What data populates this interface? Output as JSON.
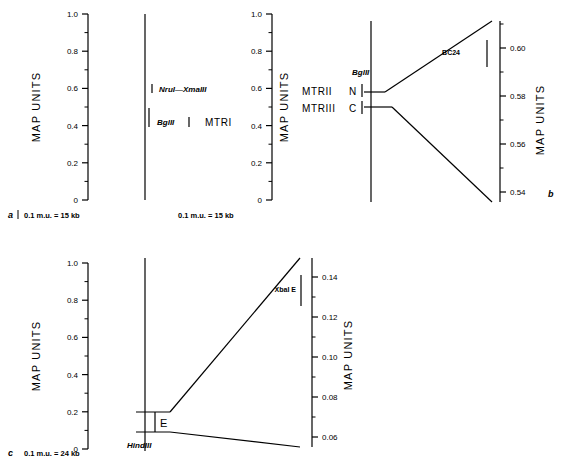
{
  "figure": {
    "axis_title": "MAP UNITS",
    "panels": [
      {
        "id": "a",
        "letter": "a",
        "scale_note": "0.1 m.u. = 15 kb",
        "left_axis": {
          "min": 0,
          "max": 1.0,
          "major_ticks": [
            "0",
            "0.2",
            "0.4",
            "0.6",
            "0.8",
            "1.0"
          ],
          "major_values": [
            0,
            0.2,
            0.4,
            0.6,
            0.8,
            1.0
          ],
          "minor_values": [
            0.1,
            0.3,
            0.5,
            0.7,
            0.9
          ]
        },
        "right_axis": {
          "min": 0,
          "max": 1.0,
          "major_ticks": [
            "0",
            "0.2",
            "0.4",
            "0.6",
            "0.8",
            "1.0"
          ],
          "major_values": [
            0,
            0.2,
            0.4,
            0.6,
            0.8,
            1.0
          ],
          "minor_values": [
            0.1,
            0.3,
            0.5,
            0.7,
            0.9
          ]
        },
        "right_scale_note": "0.1 m.u. = 15 kb",
        "chromosome_line": {
          "top_value": 1.0,
          "bottom_value": 0.0
        },
        "markers": [
          {
            "label": "NruI—XmaIII",
            "value": 0.6,
            "side": "right"
          },
          {
            "label": "BglII",
            "value": 0.42,
            "side": "right"
          }
        ],
        "locus": {
          "label": "MTRI",
          "value": 0.42
        }
      },
      {
        "id": "b",
        "letter": "b",
        "left_axis": null,
        "expanded_axis": {
          "min": 0.535,
          "max": 0.612,
          "major_ticks": [
            "0.54",
            "0.56",
            "0.58",
            "0.60"
          ],
          "major_values": [
            0.54,
            0.56,
            0.58,
            0.6
          ],
          "minor_values": [
            0.55,
            0.57,
            0.59,
            0.61
          ]
        },
        "chromosome_line": {
          "top_value": 1.0,
          "bottom_value": 0.0
        },
        "markers": [
          {
            "label": "BglII",
            "value": 0.583,
            "side": "above"
          }
        ],
        "loci": [
          {
            "name": "MTRII",
            "terminus": "N",
            "value": 0.583
          },
          {
            "name": "MTRIII",
            "terminus": "C",
            "value": 0.558
          }
        ],
        "clone": {
          "label": "BC24",
          "top_value": 0.608,
          "bottom_value": 0.596
        }
      },
      {
        "id": "c",
        "letter": "c",
        "scale_note": "0.1 m.u. = 24 kb",
        "left_axis": {
          "min": 0,
          "max": 1.0,
          "major_ticks": [
            "0",
            "0.2",
            "0.4",
            "0.6",
            "0.8",
            "1.0"
          ],
          "major_values": [
            0,
            0.2,
            0.4,
            0.6,
            0.8,
            1.0
          ],
          "minor_values": [
            0.1,
            0.3,
            0.5,
            0.7,
            0.9
          ]
        },
        "expanded_axis": {
          "min": 0.057,
          "max": 0.152,
          "major_ticks": [
            "0.06",
            "0.08",
            "0.10",
            "0.12",
            "0.14"
          ],
          "major_values": [
            0.06,
            0.08,
            0.1,
            0.12,
            0.14
          ],
          "minor_values": [
            0.07,
            0.09,
            0.11,
            0.13,
            0.15
          ]
        },
        "chromosome_line": {
          "top_value": 1.0,
          "bottom_value": 0.0
        },
        "markers": [
          {
            "label": "HindIII",
            "value": 0.05,
            "side": "below"
          }
        ],
        "fragment": {
          "label": "E",
          "top_value": 0.152,
          "bottom_value": 0.05
        },
        "clone": {
          "label": "XbaI E",
          "top_value": 0.138,
          "bottom_value": 0.118
        }
      }
    ]
  }
}
